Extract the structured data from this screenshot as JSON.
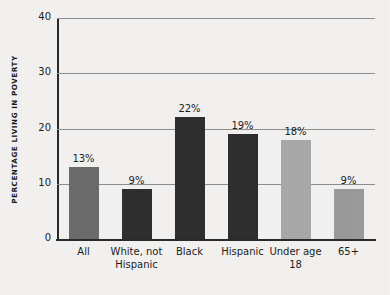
{
  "chart_data": {
    "type": "bar",
    "title": "",
    "partial_title_cropped": true,
    "xlabel": "",
    "ylabel": "PERCENTAGE LIVING IN POVERTY",
    "categories": [
      "All",
      "White, not Hispanic",
      "Black",
      "Hispanic",
      "Under age 18",
      "65+"
    ],
    "values": [
      13,
      9,
      22,
      19,
      18,
      9
    ],
    "data_labels": [
      "13%",
      "9%",
      "22%",
      "19%",
      "18%",
      "9%"
    ],
    "bar_colors": [
      "#6b6b6b",
      "#2e2e2e",
      "#2e2e2e",
      "#2e2e2e",
      "#a8a8a8",
      "#9a9a9a"
    ],
    "ylim": [
      0,
      40
    ],
    "yticks": [
      0,
      10,
      20,
      30,
      40
    ],
    "ytick_labels": [
      "0",
      "10",
      "20",
      "30",
      "40"
    ],
    "grid": true,
    "grid_axis": "y",
    "legend": "none",
    "background_color": "#f2f1ef",
    "axis_color": "#2a2a2a",
    "gridline_color": "#8d8d8d"
  }
}
